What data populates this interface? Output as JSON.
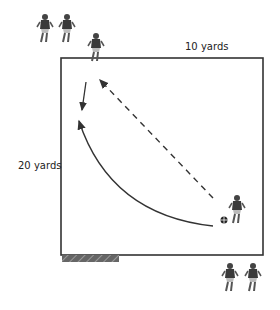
{
  "diagram": {
    "field": {
      "shape": "square grid",
      "width_label": "10 yards",
      "height_label": "20 yards"
    },
    "labels": {
      "top": "10 yards",
      "left": "20 yards"
    },
    "goal_marker": "hatched-bar",
    "players": {
      "top_left_group": 3,
      "inside_bottom_right": 1,
      "below_bottom_right": 2
    },
    "ball": "ball-icon",
    "paths": [
      {
        "type": "dashed-arrow",
        "from": "bottom-right player",
        "to": "top-left player",
        "meaning": "pass"
      },
      {
        "type": "solid-arrow",
        "from": "top-left player",
        "to": "down",
        "meaning": "player run"
      },
      {
        "type": "curved-arrow",
        "from": "ball",
        "to": "top-left area",
        "meaning": "dribble/curved run"
      }
    ],
    "colors": {
      "line": "#333333",
      "player": "#3a3a3a",
      "hatch": "#555555"
    }
  }
}
